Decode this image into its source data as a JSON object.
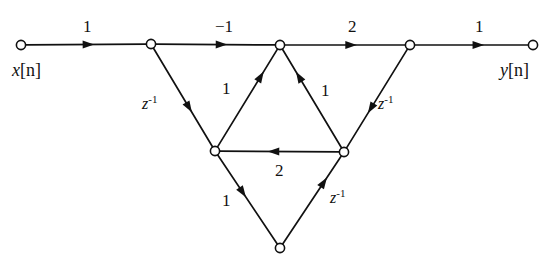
{
  "figure": {
    "background_color": "#ffffff",
    "line_color": "#111111",
    "node_fill": "#ffffff"
  },
  "io": {
    "input": {
      "var": "x",
      "index": "[n]"
    },
    "output": {
      "var": "y",
      "index": "[n]"
    }
  },
  "nodes": [
    {
      "id": "n1",
      "name": "input-node",
      "x": 21,
      "y": 45
    },
    {
      "id": "n2",
      "name": "node-2",
      "x": 151,
      "y": 44
    },
    {
      "id": "n3",
      "name": "node-3-top-center",
      "x": 280,
      "y": 45
    },
    {
      "id": "n4",
      "name": "node-4",
      "x": 410,
      "y": 45
    },
    {
      "id": "n5",
      "name": "output-node",
      "x": 533,
      "y": 45
    },
    {
      "id": "n6",
      "name": "node-6-left-lower",
      "x": 215,
      "y": 151
    },
    {
      "id": "n7",
      "name": "node-7-right-lower",
      "x": 344,
      "y": 152
    },
    {
      "id": "n8",
      "name": "node-8-bottom",
      "x": 280,
      "y": 248
    }
  ],
  "branches": [
    {
      "id": "b1",
      "name": "branch-input-to-node2",
      "from": "n1",
      "to": "n2",
      "gain": "1",
      "type": "gain",
      "arrow_t": 0.52,
      "label_x": 83,
      "label_y": 18
    },
    {
      "id": "b2",
      "name": "branch-node2-to-node3",
      "from": "n2",
      "to": "n3",
      "gain": "-1",
      "type": "gain",
      "arrow_t": 0.55,
      "label_x": 215,
      "label_y": 18
    },
    {
      "id": "b3",
      "name": "branch-node3-to-node4",
      "from": "n3",
      "to": "n4",
      "gain": "2",
      "type": "gain",
      "arrow_t": 0.55,
      "label_x": 348,
      "label_y": 18
    },
    {
      "id": "b4",
      "name": "branch-node4-to-output",
      "from": "n4",
      "to": "n5",
      "gain": "1",
      "type": "gain",
      "arrow_t": 0.56,
      "label_x": 475,
      "label_y": 18
    },
    {
      "id": "b5",
      "name": "branch-node2-to-node6",
      "from": "n2",
      "to": "n6",
      "gain": "z",
      "exp": "-1",
      "type": "delay",
      "arrow_t": 0.6,
      "label_x": 142,
      "label_y": 96
    },
    {
      "id": "b6",
      "name": "branch-node6-to-node3",
      "from": "n6",
      "to": "n3",
      "gain": "1",
      "type": "gain",
      "arrow_t": 0.72,
      "label_x": 222,
      "label_y": 80
    },
    {
      "id": "b7",
      "name": "branch-node7-to-node3",
      "from": "n7",
      "to": "n3",
      "gain": "1",
      "type": "gain",
      "arrow_t": 0.72,
      "label_x": 321,
      "label_y": 82
    },
    {
      "id": "b8",
      "name": "branch-node4-to-node7",
      "from": "n4",
      "to": "n7",
      "gain": "z",
      "exp": "-1",
      "type": "delay",
      "arrow_t": 0.6,
      "label_x": 378,
      "label_y": 96
    },
    {
      "id": "b9",
      "name": "branch-node7-to-node6",
      "from": "n7",
      "to": "n6",
      "gain": "2",
      "type": "gain",
      "arrow_t": 0.55,
      "label_x": 275,
      "label_y": 162
    },
    {
      "id": "b10",
      "name": "branch-node6-to-node8",
      "from": "n6",
      "to": "n8",
      "gain": "1",
      "type": "gain",
      "arrow_t": 0.42,
      "label_x": 222,
      "label_y": 192
    },
    {
      "id": "b11",
      "name": "branch-node8-to-node7",
      "from": "n8",
      "to": "n7",
      "gain": "z",
      "exp": "-1",
      "type": "delay",
      "arrow_t": 0.7,
      "label_x": 330,
      "label_y": 190
    }
  ]
}
